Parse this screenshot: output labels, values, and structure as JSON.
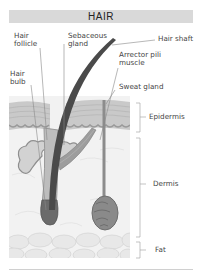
{
  "title": "HAIR",
  "labels": {
    "hair_follicle": "Hair\nfollicle",
    "sebaceous_gland": "Sebaceous\ngland",
    "hair_shaft": "Hair shaft",
    "arrector_pili": "Arrector pili\nmuscle",
    "hair_bulb": "Hair\nbulb",
    "sweat_gland": "Sweat gland"
  },
  "layers": {
    "epidermis": "Epidermis",
    "dermis": "Dermis",
    "fat": "Fat"
  },
  "colors": {
    "title_bar": "#d9d9d9",
    "hair": "#4a4a4a",
    "epidermis": "#c8c8c8",
    "dermis": "#f0f0f0",
    "fat": "#e6e6e6",
    "gland": "#8a8a8a",
    "leader_line": "#888888"
  }
}
